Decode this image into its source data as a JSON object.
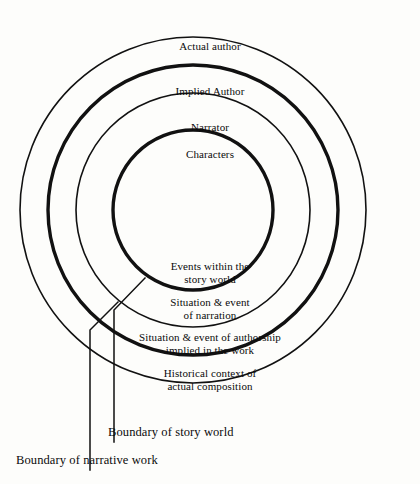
{
  "diagram": {
    "background_color": "#fdfdfb",
    "line_color": "#111111",
    "center": {
      "x": 193,
      "y": 210
    },
    "rings": [
      {
        "id": "ring-outer",
        "name": "actual-author-ring",
        "radius": 173,
        "stroke": "thin",
        "top_label": "Actual author",
        "bottom_label_line1": "Historical context of",
        "bottom_label_line2": "actual composition"
      },
      {
        "id": "ring-second",
        "name": "implied-author-ring",
        "radius": 145,
        "stroke": "thick",
        "top_label": "Implied Author",
        "bottom_label_line1": "Situation & event of authorship",
        "bottom_label_line2": "implied in the work"
      },
      {
        "id": "ring-third",
        "name": "narrator-ring",
        "radius": 117,
        "stroke": "thin",
        "top_label": "Narrator",
        "bottom_label_line1": "Situation & event",
        "bottom_label_line2": "of narration"
      },
      {
        "id": "ring-inner",
        "name": "characters-ring",
        "radius": 80,
        "stroke": "thick",
        "top_label": "Characters",
        "bottom_label_line1": "Events within the",
        "bottom_label_line2": "story world"
      }
    ],
    "callouts": [
      {
        "id": "callout-story-world",
        "name": "boundary-of-story-world",
        "label": "Boundary of story world",
        "label_x": 108,
        "label_y": 425,
        "path": "M 145 278 L 114 310 L 114 442"
      },
      {
        "id": "callout-narrative-work",
        "name": "boundary-of-narrative-work",
        "label": "Boundary of narrative work",
        "label_x": 16,
        "label_y": 453,
        "path": "M 118 302 L 90 330 L 90 470"
      }
    ]
  }
}
